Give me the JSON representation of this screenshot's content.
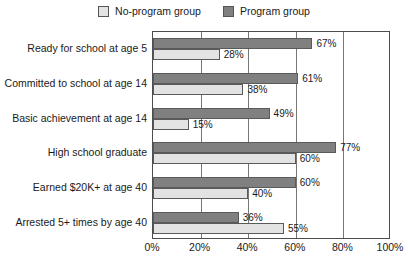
{
  "chart_data": {
    "type": "bar",
    "orientation": "horizontal",
    "title": "",
    "xlabel": "",
    "ylabel": "",
    "xlim": [
      0,
      100
    ],
    "xticks": [
      "0%",
      "20%",
      "40%",
      "60%",
      "80%",
      "100%"
    ],
    "xtick_values": [
      0,
      20,
      40,
      60,
      80,
      100
    ],
    "grid": true,
    "legend_position": "top-center",
    "categories": [
      "Ready for school at age 5",
      "Committed to school at age 14",
      "Basic achievement at age 14",
      "High school graduate",
      "Earned $20K+ at age 40",
      "Arrested 5+ times by age 40"
    ],
    "series": [
      {
        "name": "Program group",
        "color": "#808080",
        "values": [
          67,
          61,
          49,
          77,
          60,
          36
        ],
        "labels": [
          "67%",
          "61%",
          "49%",
          "77%",
          "60%",
          "36%"
        ]
      },
      {
        "name": "No-program group",
        "color": "#e3e3e3",
        "values": [
          28,
          38,
          15,
          60,
          40,
          55
        ],
        "labels": [
          "28%",
          "38%",
          "15%",
          "60%",
          "40%",
          "55%"
        ]
      }
    ]
  },
  "legend": {
    "entries": [
      {
        "label": "No-program group",
        "swatch": "light"
      },
      {
        "label": "Program group",
        "swatch": "dark"
      }
    ]
  }
}
